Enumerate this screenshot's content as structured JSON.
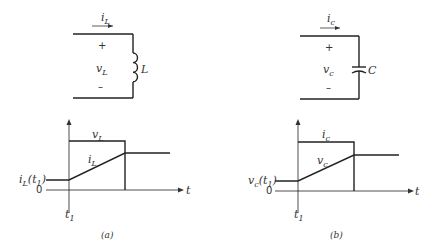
{
  "panel_a": {
    "current_label": "i",
    "current_sub": "L",
    "voltage_label": "v",
    "voltage_sub": "L",
    "plus": "+",
    "minus": "–",
    "element_label": "L",
    "element_type": "inductor",
    "graph": {
      "top_trace_label": "v",
      "top_trace_sub": "L",
      "ramp_trace_label": "i",
      "ramp_trace_sub": "L",
      "initial_label": "i",
      "initial_sub": "L",
      "initial_arg": "(t",
      "initial_arg_sub": "1",
      "initial_arg_close": ")",
      "zero_label": "0",
      "t_axis_label": "t",
      "t1_label": "t",
      "t1_sub": "1"
    },
    "caption": "(a)"
  },
  "panel_b": {
    "current_label": "i",
    "current_sub": "c",
    "voltage_label": "v",
    "voltage_sub": "c",
    "plus": "+",
    "minus": "–",
    "element_label": "C",
    "element_type": "capacitor",
    "graph": {
      "top_trace_label": "i",
      "top_trace_sub": "c",
      "ramp_trace_label": "v",
      "ramp_trace_sub": "c",
      "initial_label": "v",
      "initial_sub": "c",
      "initial_arg": "(t",
      "initial_arg_sub": "1",
      "initial_arg_close": ")",
      "zero_label": "0",
      "t_axis_label": "t",
      "t1_label": "t",
      "t1_sub": "1"
    },
    "caption": "(b)"
  },
  "colors": {
    "line": "#222222",
    "text": "#333333",
    "background": "#ffffff"
  }
}
